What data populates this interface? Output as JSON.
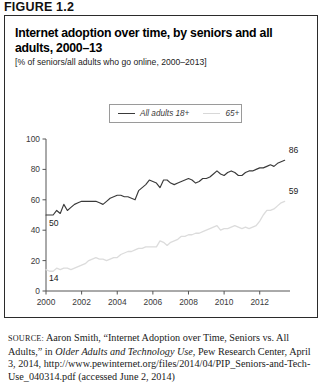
{
  "figure": {
    "number_label": "FIGURE 1.2",
    "title": "Internet adoption over time, by seniors and all adults, 2000–13",
    "subtitle": "[% of seniors/all adults who go online, 2000–2013]"
  },
  "legend": {
    "adults_label": "All adults 18+",
    "seniors_label": "65+"
  },
  "source": {
    "label": "source:",
    "text_part1": " Aaron Smith, “Internet Adoption over Time, Seniors vs. All Adults,” in ",
    "italic_title": "Older Adults and Technology Use",
    "text_part2": ", Pew Research Center, April 3, 2014, http://www.pewinternet.org/files/2014/04/PIP_Seniors-and-Tech-Use_040314.pdf (accessed June 2, 2014)"
  },
  "colors": {
    "adults_line": "#3a3a3a",
    "seniors_line": "#dcdcdc",
    "axis": "#555555",
    "border": "#2b2b2b",
    "legend_border": "#9a9a9a"
  },
  "chart_data": {
    "type": "line",
    "title": "Internet adoption over time, by seniors and all adults, 2000–13",
    "subtitle": "[% of seniors/all adults who go online, 2000–2013]",
    "xlabel": "",
    "ylabel": "",
    "xlim": [
      2000,
      2013.7
    ],
    "ylim": [
      0,
      100
    ],
    "grid": false,
    "legend_position": "top-center",
    "yticks": [
      0,
      20,
      40,
      60,
      80,
      100
    ],
    "ytick_labels": [
      "0",
      "20",
      "40",
      "60",
      "80",
      "100"
    ],
    "xticks": [
      2000,
      2002,
      2004,
      2006,
      2008,
      2010,
      2012
    ],
    "xtick_labels": [
      "2000",
      "2002",
      "2004",
      "2006",
      "2008",
      "2010",
      "2012"
    ],
    "endpoint_labels": [
      {
        "series": "All adults 18+",
        "position": "start",
        "value": 50,
        "text": "50"
      },
      {
        "series": "65+",
        "position": "start",
        "value": 14,
        "text": "14"
      },
      {
        "series": "All adults 18+",
        "position": "end",
        "value": 86,
        "text": "86"
      },
      {
        "series": "65+",
        "position": "end",
        "value": 59,
        "text": "59"
      }
    ],
    "x": [
      2000.0,
      2000.2,
      2000.4,
      2000.6,
      2000.8,
      2001.0,
      2001.2,
      2001.4,
      2001.6,
      2001.8,
      2002.0,
      2002.2,
      2002.4,
      2002.6,
      2002.8,
      2003.0,
      2003.2,
      2003.4,
      2003.6,
      2003.8,
      2004.0,
      2004.2,
      2004.4,
      2004.6,
      2004.8,
      2005.0,
      2005.2,
      2005.4,
      2005.6,
      2005.8,
      2006.0,
      2006.2,
      2006.4,
      2006.6,
      2006.8,
      2007.0,
      2007.2,
      2007.4,
      2007.6,
      2007.8,
      2008.0,
      2008.2,
      2008.4,
      2008.6,
      2008.8,
      2009.0,
      2009.2,
      2009.4,
      2009.6,
      2009.8,
      2010.0,
      2010.2,
      2010.4,
      2010.6,
      2010.8,
      2011.0,
      2011.2,
      2011.4,
      2011.6,
      2011.8,
      2012.0,
      2012.2,
      2012.4,
      2012.6,
      2012.8,
      2013.0,
      2013.2,
      2013.4
    ],
    "series": [
      {
        "name": "All adults 18+",
        "color": "#3a3a3a",
        "values": [
          50,
          50,
          50,
          53,
          51,
          57,
          53,
          55,
          57,
          58,
          59,
          59,
          59,
          59,
          59,
          58,
          57,
          59,
          61,
          62,
          63,
          63,
          62,
          62,
          61,
          60,
          66,
          68,
          70,
          73,
          72,
          71,
          68,
          73,
          73,
          71,
          70,
          71,
          72,
          73,
          74,
          73,
          71,
          72,
          74,
          74,
          75,
          77,
          79,
          77,
          76,
          78,
          79,
          78,
          76,
          76,
          78,
          79,
          79,
          80,
          81,
          81,
          82,
          83,
          82,
          84,
          85,
          86
        ]
      },
      {
        "name": "65+",
        "color": "#dcdcdc",
        "values": [
          14,
          13,
          13,
          15,
          14,
          15,
          15,
          14,
          15,
          16,
          17,
          18,
          20,
          21,
          22,
          21,
          21,
          20,
          21,
          22,
          22,
          24,
          25,
          26,
          26,
          27,
          28,
          28,
          29,
          29,
          29,
          29,
          33,
          32,
          30,
          32,
          33,
          34,
          36,
          36,
          37,
          37,
          38,
          38,
          39,
          40,
          41,
          42,
          43,
          40,
          41,
          41,
          42,
          43,
          42,
          41,
          42,
          41,
          42,
          43,
          46,
          50,
          53,
          53,
          54,
          56,
          58,
          59
        ]
      }
    ]
  }
}
